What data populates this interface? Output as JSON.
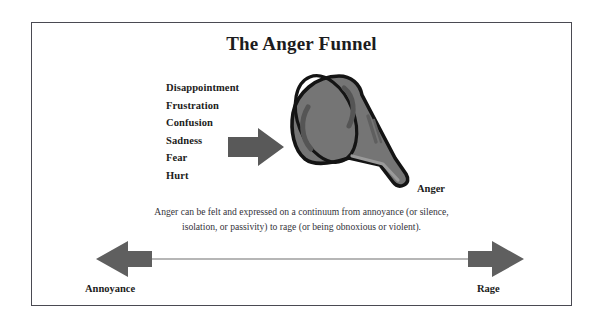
{
  "figure": {
    "title": "The Anger Funnel",
    "frame_color": "#4a4a52",
    "background_color": "#ffffff"
  },
  "emotions": {
    "heading": "",
    "items": [
      {
        "label": "Disappointment"
      },
      {
        "label": "Frustration"
      },
      {
        "label": "Confusion"
      },
      {
        "label": "Sadness"
      },
      {
        "label": "Fear"
      },
      {
        "label": "Hurt"
      }
    ]
  },
  "funnel": {
    "output_label": "Anger",
    "fill_color": "#757575",
    "outline_color": "#141414",
    "highlight_color": "#5a5a5a"
  },
  "input_arrow": {
    "name": "right-arrow",
    "color": "#595959"
  },
  "caption": {
    "line1": "Anger can be felt and expressed on a continuum from annoyance (or silence,",
    "line2": "isolation, or passivity) to rage (or being obnoxious or violent)."
  },
  "continuum": {
    "left_label": "Annoyance",
    "right_label": "Rage",
    "arrow_color": "#5f5f5f",
    "line_color": "#6e6e6e"
  }
}
